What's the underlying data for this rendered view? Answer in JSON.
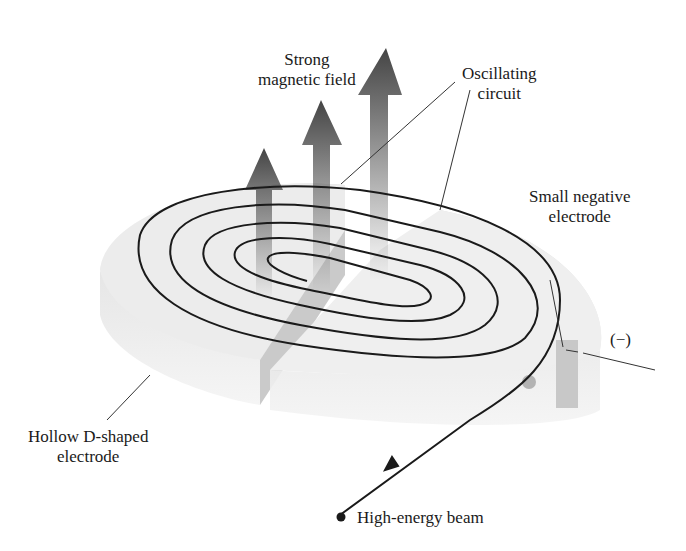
{
  "diagram": {
    "type": "cyclotron-illustration",
    "labels": {
      "magnetic_field": [
        "Strong",
        "magnetic field"
      ],
      "oscillating_circuit": [
        "Oscillating",
        "circuit"
      ],
      "small_negative_electrode": [
        "Small negative",
        "electrode"
      ],
      "negative_sign": "(−)",
      "hollow_electrode": [
        "Hollow D-shaped",
        "electrode"
      ],
      "beam": "High-energy beam"
    },
    "colors": {
      "line": "#1a1a1a",
      "electrode_fill": "#e6e6e6",
      "electrode_side": "#cfcfcf",
      "arrow": "#555555"
    }
  }
}
